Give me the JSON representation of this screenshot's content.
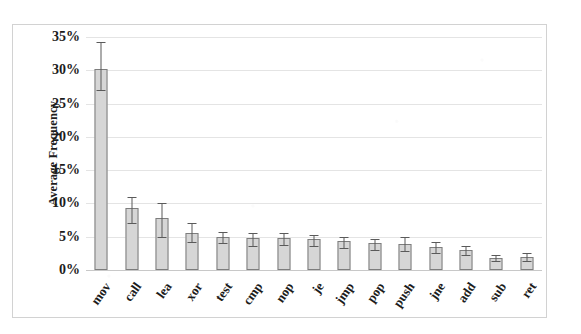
{
  "chart_data": {
    "type": "bar",
    "title": "",
    "subtitle": "",
    "xlabel": "",
    "ylabel": "Average Frequency",
    "ylim": [
      0,
      35
    ],
    "ytick_labels": [
      "0%",
      "5%",
      "10%",
      "15%",
      "20%",
      "25%",
      "30%",
      "35%"
    ],
    "ytick_values": [
      0,
      5,
      10,
      15,
      20,
      25,
      30,
      35
    ],
    "grid": true,
    "legend": null,
    "error_bars": "visible",
    "units": "percent",
    "categories": [
      "mov",
      "call",
      "lea",
      "xor",
      "test",
      "cmp",
      "nop",
      "je",
      "jmp",
      "pop",
      "push",
      "jne",
      "add",
      "sub",
      "ret"
    ],
    "values": [
      30.2,
      9.3,
      7.8,
      5.6,
      5.0,
      4.8,
      4.8,
      4.7,
      4.3,
      4.0,
      3.9,
      3.4,
      3.0,
      1.8,
      1.9
    ],
    "error_low": [
      27.0,
      7.0,
      5.0,
      4.2,
      4.1,
      3.6,
      3.7,
      3.6,
      3.3,
      3.0,
      2.8,
      2.6,
      2.2,
      1.4,
      1.4
    ],
    "error_high": [
      34.2,
      11.0,
      10.0,
      7.0,
      5.7,
      5.6,
      5.5,
      5.3,
      5.0,
      4.7,
      4.9,
      4.2,
      3.6,
      2.3,
      2.5
    ],
    "series": [
      {
        "name": "Average Frequency",
        "values": [
          30.2,
          9.3,
          7.8,
          5.6,
          5.0,
          4.8,
          4.8,
          4.7,
          4.3,
          4.0,
          3.9,
          3.4,
          3.0,
          1.8,
          1.9
        ]
      }
    ],
    "colors": {
      "bar_fill": "#d6d6d6",
      "bar_stroke": "#7d7d7d",
      "error_bar": "#5a5a5a",
      "gridline": "#e4e4e4",
      "baseline": "#c8c8c8",
      "frame": "#d2d2d2",
      "text": "#1c1c1c",
      "background": "#ffffff"
    }
  }
}
